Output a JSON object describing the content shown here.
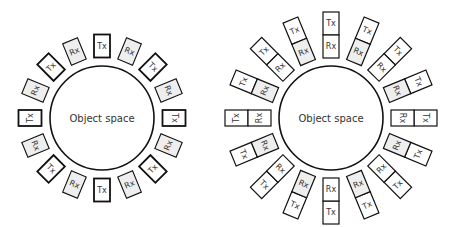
{
  "colors": {
    "stroke": "#111111",
    "gray_fill": "#eeeeee",
    "white_fill": "#ffffff",
    "text": "#333333"
  },
  "left_diagram": {
    "center": [
      102,
      118
    ],
    "circle_radius": 52,
    "label": "Object space",
    "element_radius": 72,
    "element_size": [
      16,
      23
    ],
    "elements": [
      {
        "angle": 0,
        "type": "Tx",
        "label": "Tx"
      },
      {
        "angle": 22.5,
        "type": "Rx",
        "label": "Rx"
      },
      {
        "angle": 45,
        "type": "Tx",
        "label": "Tx"
      },
      {
        "angle": 67.5,
        "type": "Rx",
        "label": "Rx"
      },
      {
        "angle": 90,
        "type": "Tx",
        "label": "Tx"
      },
      {
        "angle": 112.5,
        "type": "Rx",
        "label": "Rx"
      },
      {
        "angle": 135,
        "type": "Tx",
        "label": "Tx"
      },
      {
        "angle": 157.5,
        "type": "Rx",
        "label": "Rx"
      },
      {
        "angle": 180,
        "type": "Tx",
        "label": "Tx"
      },
      {
        "angle": 202.5,
        "type": "Rx",
        "label": "Rx"
      },
      {
        "angle": 225,
        "type": "Tx",
        "label": "Tx"
      },
      {
        "angle": 247.5,
        "type": "Rx",
        "label": "Rx"
      },
      {
        "angle": 270,
        "type": "Tx",
        "label": "Tx"
      },
      {
        "angle": 292.5,
        "type": "Rx",
        "label": "Rx"
      },
      {
        "angle": 315,
        "type": "Tx",
        "label": "Tx"
      },
      {
        "angle": 337.5,
        "type": "Rx",
        "label": "Rx"
      }
    ]
  },
  "right_diagram": {
    "center": [
      331,
      118
    ],
    "circle_radius": 52,
    "label": "Object space",
    "module_radius": 83,
    "cell_size": [
      16,
      23
    ],
    "modules": [
      {
        "angle": 0,
        "outer": "Tx",
        "inner": "Rx",
        "inner_gray": false
      },
      {
        "angle": 22.5,
        "outer": "Tx",
        "inner": "Rx",
        "inner_gray": true
      },
      {
        "angle": 45,
        "outer": "Tx",
        "inner": "Rx",
        "inner_gray": false
      },
      {
        "angle": 67.5,
        "outer": "Tx",
        "inner": "Rx",
        "inner_gray": true
      },
      {
        "angle": 90,
        "outer": "Tx",
        "inner": "Rx",
        "inner_gray": false
      },
      {
        "angle": 112.5,
        "outer": "Tx",
        "inner": "Rx",
        "inner_gray": true
      },
      {
        "angle": 135,
        "outer": "Tx",
        "inner": "Rx",
        "inner_gray": false
      },
      {
        "angle": 157.5,
        "outer": "Tx",
        "inner": "Rx",
        "inner_gray": true
      },
      {
        "angle": 180,
        "outer": "Tx",
        "inner": "Rx",
        "inner_gray": false
      },
      {
        "angle": 202.5,
        "outer": "Tx",
        "inner": "Rx",
        "inner_gray": true
      },
      {
        "angle": 225,
        "outer": "Tx",
        "inner": "Rx",
        "inner_gray": false
      },
      {
        "angle": 247.5,
        "outer": "Tx",
        "inner": "Rx",
        "inner_gray": true
      },
      {
        "angle": 270,
        "outer": "Tx",
        "inner": "Rx",
        "inner_gray": false
      },
      {
        "angle": 292.5,
        "outer": "Tx",
        "inner": "Rx",
        "inner_gray": true
      },
      {
        "angle": 315,
        "outer": "Tx",
        "inner": "Rx",
        "inner_gray": false
      },
      {
        "angle": 337.5,
        "outer": "Tx",
        "inner": "Rx",
        "inner_gray": true
      }
    ]
  }
}
